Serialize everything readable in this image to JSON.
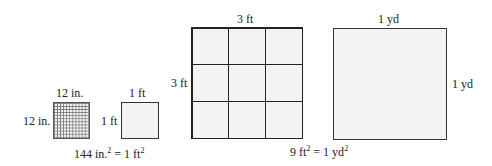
{
  "figures": {
    "square_inches": {
      "top_label": "12 in.",
      "side_label": "12 in.",
      "grid_divisions": 12
    },
    "square_foot_small": {
      "top_label": "1 ft",
      "side_label": "1 ft"
    },
    "equation_1": {
      "left": "144 in.",
      "left_exp": "2",
      "mid": " = 1 ft",
      "right_exp": "2"
    },
    "square_feet": {
      "top_label": "3 ft",
      "side_label": "3 ft",
      "grid_divisions": 3
    },
    "square_yard": {
      "top_label": "1 yd",
      "side_label": "1 yd"
    },
    "equation_2": {
      "left": "9 ft",
      "left_exp": "2",
      "mid": " = 1 yd",
      "right_exp": "2"
    }
  },
  "colors": {
    "line": "#222222",
    "fill": "#f3f3f3",
    "background": "#ffffff"
  }
}
